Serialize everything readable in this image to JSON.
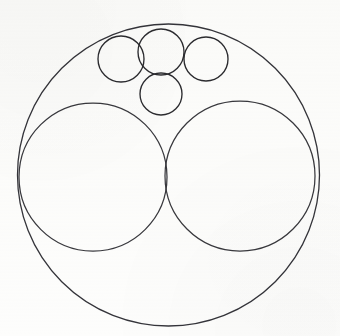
{
  "figure": {
    "background_color": "#fdfdfc",
    "stroke_color": "#2e2e30",
    "width": 340,
    "height": 336
  },
  "chart_data": {
    "type": "diagram",
    "subtype": "circle-packing",
    "xlabel": "",
    "ylabel": "",
    "units": "pixels",
    "coordinate_origin": "top-left",
    "xlim": [
      0,
      340
    ],
    "ylim": [
      0,
      336
    ],
    "grid": false,
    "legend": false,
    "annotations": [],
    "circles": [
      {
        "name": "outer-boundary-circle",
        "role": "container",
        "cx": 168.5,
        "cy": 175.0,
        "r": 151.0,
        "stroke": "#34343a",
        "stroke_width": 1.3,
        "fill": "none"
      },
      {
        "name": "large-left-circle",
        "role": "inscribed-major",
        "cx": 93.0,
        "cy": 177.0,
        "r": 74.0,
        "stroke": "#38383d",
        "stroke_width": 1.25,
        "fill": "none"
      },
      {
        "name": "large-right-circle",
        "role": "inscribed-major",
        "cx": 240.0,
        "cy": 176.0,
        "r": 75.0,
        "stroke": "#38383d",
        "stroke_width": 1.25,
        "fill": "none"
      },
      {
        "name": "small-top-left-circle",
        "role": "inscribed-minor",
        "cx": 121.0,
        "cy": 59.0,
        "r": 23.0,
        "stroke": "#2b2b2f",
        "stroke_width": 1.35,
        "fill": "none"
      },
      {
        "name": "small-top-middle-circle",
        "role": "inscribed-minor",
        "cx": 161.0,
        "cy": 52.0,
        "r": 23.0,
        "stroke": "#2b2b2f",
        "stroke_width": 1.35,
        "fill": "none"
      },
      {
        "name": "small-top-right-circle",
        "role": "inscribed-minor",
        "cx": 206.0,
        "cy": 59.0,
        "r": 22.0,
        "stroke": "#2b2b2f",
        "stroke_width": 1.35,
        "fill": "none"
      },
      {
        "name": "small-bottom-middle-circle",
        "role": "inscribed-minor",
        "cx": 161.0,
        "cy": 94.0,
        "r": 21.0,
        "stroke": "#2b2b2f",
        "stroke_width": 1.35,
        "fill": "none"
      }
    ],
    "counts": {
      "total_circles": 7,
      "container_circles": 1,
      "large_circles": 2,
      "small_circles": 4
    }
  }
}
